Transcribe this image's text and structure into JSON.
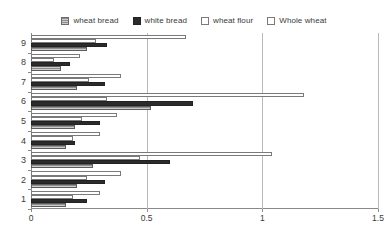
{
  "legend": {
    "items": [
      {
        "label": "wheat bread",
        "key": "wheat-bread",
        "color": "#8E8E8E",
        "style": "hatched"
      },
      {
        "label": "white bread",
        "key": "white-bread",
        "color": "#2B2B2B",
        "style": "solid"
      },
      {
        "label": "wheat flour",
        "key": "wheat-flour",
        "color": "#FFFFFF",
        "style": "outline"
      },
      {
        "label": "Whole wheat",
        "key": "whole-wheat",
        "color": "#FFFFFF",
        "style": "outline"
      }
    ]
  },
  "axes": {
    "x_ticks": [
      "0",
      "0.5",
      "1",
      "1.5"
    ],
    "x_tick_values": [
      0,
      0.5,
      1,
      1.5
    ],
    "y_ticks": [
      "1",
      "2",
      "3",
      "4",
      "5",
      "6",
      "7",
      "8",
      "9"
    ]
  },
  "chart_data": {
    "type": "bar",
    "orientation": "horizontal",
    "title": "",
    "xlabel": "",
    "ylabel": "",
    "xlim": [
      0,
      1.5
    ],
    "grid": true,
    "legend_position": "top",
    "categories": [
      "1",
      "2",
      "3",
      "4",
      "5",
      "6",
      "7",
      "8",
      "9"
    ],
    "series": [
      {
        "name": "wheat bread",
        "values": [
          0.15,
          0.2,
          0.27,
          0.15,
          0.19,
          0.52,
          0.2,
          0.13,
          0.24
        ]
      },
      {
        "name": "white bread",
        "values": [
          0.24,
          0.32,
          0.6,
          0.19,
          0.3,
          0.7,
          0.32,
          0.17,
          0.33
        ]
      },
      {
        "name": "wheat flour",
        "values": [
          0.18,
          0.24,
          0.47,
          0.18,
          0.22,
          0.33,
          0.25,
          0.1,
          0.28
        ]
      },
      {
        "name": "Whole wheat",
        "values": [
          0.3,
          0.39,
          1.04,
          0.3,
          0.37,
          1.18,
          0.39,
          0.21,
          0.67
        ]
      }
    ]
  }
}
